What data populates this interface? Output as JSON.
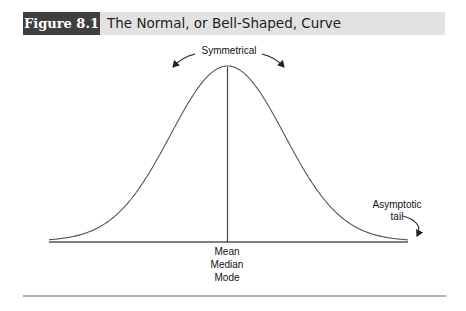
{
  "header": {
    "figure_number": "Figure 8.1",
    "title": "The Normal, or Bell-Shaped, Curve"
  },
  "chart_data": {
    "type": "line",
    "title": "The Normal, or Bell-Shaped, Curve",
    "figure_number": "Figure 8.1",
    "series": [
      {
        "name": "Normal curve",
        "x": [
          -3,
          -2.5,
          -2,
          -1.5,
          -1,
          -0.5,
          0,
          0.5,
          1,
          1.5,
          2,
          2.5,
          3
        ],
        "values": [
          0.004,
          0.018,
          0.054,
          0.13,
          0.242,
          0.352,
          0.399,
          0.352,
          0.242,
          0.13,
          0.054,
          0.018,
          0.004
        ]
      }
    ],
    "annotations": {
      "top": "Symmetrical",
      "center": [
        "Mean",
        "Median",
        "Mode"
      ],
      "right_tail": [
        "Asymptotic",
        "tail"
      ]
    },
    "xlabel": "",
    "ylabel": "",
    "grid": false,
    "legend": "none",
    "axes": {
      "x_visible": true,
      "y_visible": false,
      "ticks": false
    }
  },
  "labels": {
    "symmetrical": "Symmetrical",
    "mean": "Mean",
    "median": "Median",
    "mode": "Mode",
    "asymptotic": "Asymptotic",
    "tail": "tail"
  }
}
